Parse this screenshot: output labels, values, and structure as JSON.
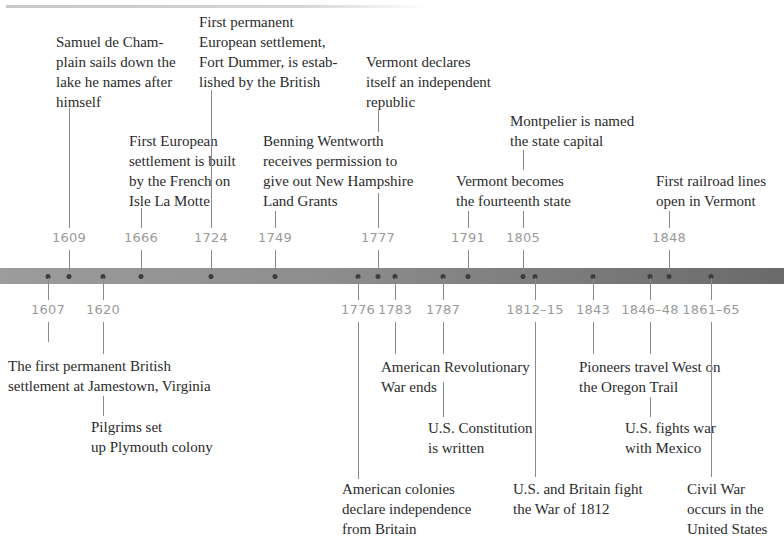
{
  "colors": {
    "bar_left": "#9c9c9c",
    "bar_right": "#6a6a6a",
    "year_text": "#9a9a9a",
    "caption_text": "#2b2b2b",
    "connector": "#8a8a8a",
    "dot": "#3d3d3d"
  },
  "top_events": [
    {
      "year": "1609",
      "text": "Samuel de Cham-\nplain sails down the\nlake he names after\nhimself"
    },
    {
      "year": "1666",
      "text": "First European\nsettlement is built\nby the French on\nIsle La Motte"
    },
    {
      "year": "1724",
      "text": "First permanent\nEuropean settlement,\nFort Dummer, is estab-\nlished by the British"
    },
    {
      "year": "1749",
      "text": "Benning Wentworth\nreceives permission to\ngive out New Hampshire\nLand Grants"
    },
    {
      "year": "1777",
      "text": "Vermont declares\nitself an independent\nrepublic"
    },
    {
      "year": "1791",
      "text": "Vermont becomes\nthe fourteenth state"
    },
    {
      "year": "1805",
      "text": "Montpelier is named\nthe state capital"
    },
    {
      "year": "1848",
      "text": "First railroad lines\nopen in Vermont"
    }
  ],
  "bottom_events": [
    {
      "year": "1607",
      "text": "The first permanent British\nsettlement at Jamestown, Virginia"
    },
    {
      "year": "1620",
      "text": "Pilgrims set\nup Plymouth colony"
    },
    {
      "year": "1776",
      "text": "American colonies\ndeclare independence\nfrom Britain"
    },
    {
      "year": "1783",
      "text": "American Revolutionary\nWar ends"
    },
    {
      "year": "1787",
      "text": "U.S. Constitution\nis written"
    },
    {
      "year": "1812–15",
      "text": "U.S. and Britain fight\nthe War of 1812"
    },
    {
      "year": "1843",
      "text": "Pioneers travel West on\nthe Oregon Trail"
    },
    {
      "year": "1846–48",
      "text": "U.S. fights war\nwith Mexico"
    },
    {
      "year": "1861–65",
      "text": "Civil War\noccurs in the\nUnited States"
    }
  ]
}
